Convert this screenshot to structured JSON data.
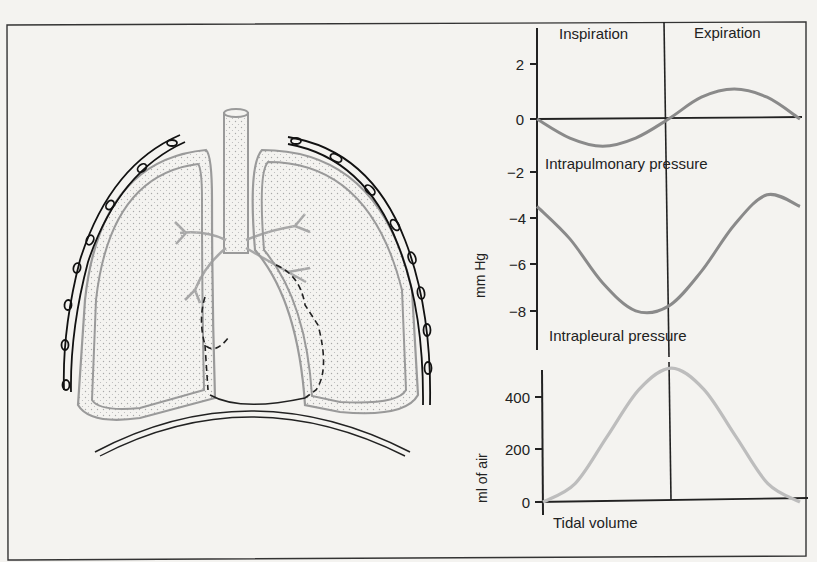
{
  "figure": {
    "phases": {
      "left": "Inspiration",
      "right": "Expiration"
    },
    "upper_axis": {
      "label": "mm Hg",
      "ticks": [
        "2",
        "0",
        "−2",
        "−4",
        "−6",
        "−8"
      ]
    },
    "lower_axis": {
      "label": "ml of air",
      "ticks": [
        "400",
        "200",
        "0"
      ]
    },
    "curve_labels": {
      "intrapulmonary": "Intrapulmonary pressure",
      "intrapleural": "Intrapleural pressure",
      "tidal": "Tidal volume"
    },
    "illustration": "lungs-in-thoracic-cavity",
    "colors": {
      "background": "#f4f3f0",
      "ink": "#222222",
      "intrapulmonary_curve": "#8a8a8a",
      "intrapleural_curve": "#8a8a8a",
      "tidal_curve": "#bdbdbd",
      "lung_outline": "#9a9a9a"
    }
  },
  "chart_data": [
    {
      "type": "line",
      "title": "Intrapulmonary pressure",
      "ylabel": "mm Hg",
      "x": [
        0,
        0.125,
        0.25,
        0.375,
        0.5,
        0.625,
        0.75,
        0.875,
        1.0
      ],
      "x_phases": [
        "Inspiration",
        "Expiration"
      ],
      "values": [
        0,
        -0.7,
        -1.0,
        -0.7,
        0,
        0.8,
        1.1,
        0.8,
        0
      ],
      "ylim": [
        -9,
        3
      ]
    },
    {
      "type": "line",
      "title": "Intrapleural pressure",
      "ylabel": "mm Hg",
      "x": [
        0,
        0.125,
        0.25,
        0.375,
        0.5,
        0.625,
        0.75,
        0.875,
        1.0
      ],
      "x_phases": [
        "Inspiration",
        "Expiration"
      ],
      "values": [
        -3.5,
        -4.9,
        -6.8,
        -8.0,
        -7.8,
        -6.3,
        -4.3,
        -3.0,
        -3.5
      ],
      "ylim": [
        -9,
        3
      ]
    },
    {
      "type": "line",
      "title": "Tidal volume",
      "ylabel": "ml of air",
      "x": [
        0,
        0.125,
        0.25,
        0.375,
        0.5,
        0.625,
        0.75,
        0.875,
        1.0
      ],
      "x_phases": [
        "Inspiration",
        "Expiration"
      ],
      "values": [
        0,
        70,
        250,
        430,
        510,
        430,
        250,
        70,
        0
      ],
      "ylim": [
        0,
        520
      ]
    }
  ]
}
